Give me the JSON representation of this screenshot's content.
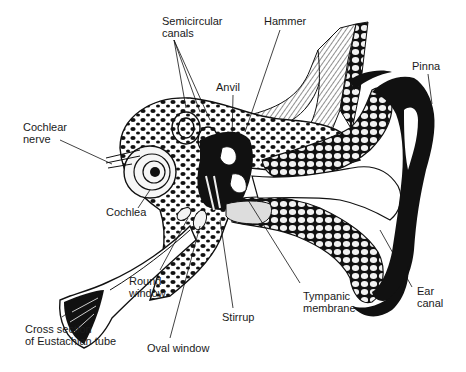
{
  "diagram": {
    "colors": {
      "ink": "#111111",
      "background": "#ffffff",
      "bone_fill": "#f4f4f4",
      "label_text": "#1a1a1a"
    },
    "labels": {
      "semicircular_canals": "Semicircular\ncanals",
      "hammer": "Hammer",
      "anvil": "Anvil",
      "pinna": "Pinna",
      "cochlear_nerve": "Cochlear\nnerve",
      "cochlea": "Cochlea",
      "round_window": "Round\nwindow",
      "cross_section_eustachian": "Cross section\nof Eustachian tube",
      "oval_window": "Oval window",
      "stirrup": "Stirrup",
      "tympanic_membrane": "Tympanic\nmembrane",
      "ear_canal": "Ear\ncanal"
    }
  }
}
